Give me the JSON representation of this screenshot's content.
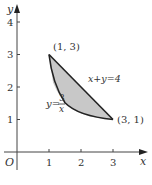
{
  "diagram": {
    "type": "coordinate-plane",
    "axes": {
      "x_label": "x",
      "y_label": "y",
      "origin_label": "O",
      "x_ticks": [
        "1",
        "2",
        "3"
      ],
      "y_ticks": [
        "1",
        "2",
        "3",
        "4"
      ]
    },
    "points": [
      {
        "label": "(1, 3)",
        "x": 1,
        "y": 3
      },
      {
        "label": "(3, 1)",
        "x": 3,
        "y": 1
      }
    ],
    "curves": [
      {
        "name": "hyperbola",
        "label_lhs": "y=",
        "label_num": "3",
        "label_den": "x"
      },
      {
        "name": "line",
        "label": "x+y=4"
      }
    ],
    "region": {
      "description": "area enclosed between y=3/x and x+y=4 from x=1 to x=3",
      "fill": "#c8c8c8"
    },
    "colors": {
      "stroke": "#222222",
      "axis": "#444444",
      "text": "#333333"
    }
  }
}
